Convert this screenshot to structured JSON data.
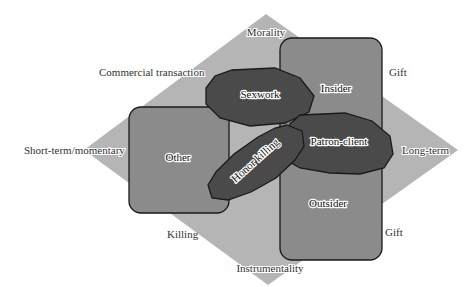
{
  "diagram": {
    "colors": {
      "diamond": "#b5b5b5",
      "box": "#8b8b8b",
      "octagon": "#4a4a4a",
      "outline": "#1a1a1a"
    },
    "axes": {
      "top": "Morality",
      "bottom": "Instrumentality",
      "left": "Short-term/momentary",
      "right": "Long-term"
    },
    "side_labels": {
      "upper_left": "Commercial transaction",
      "upper_right": "Gift",
      "lower_left": "Killing",
      "lower_right": "Gift"
    },
    "boxes": {
      "insider": "Insider",
      "outsider": "Outsider",
      "other": "Other"
    },
    "categories": {
      "sexwork": "Sexwork",
      "patron_client": "Patron-client",
      "honor_killing": "Honor killing"
    }
  }
}
